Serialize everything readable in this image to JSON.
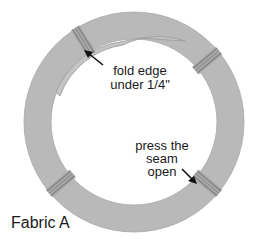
{
  "diagram": {
    "colors": {
      "fabric": "#b9b9b9",
      "fabric_edge": "#a3a3a3",
      "seam_dark": "#8c8c8c",
      "text": "#1a1a1a",
      "background": "#ffffff"
    },
    "ring": {
      "center": [
        134,
        122
      ],
      "outer_radius": 110,
      "inner_radius": 83
    },
    "seams": [
      {
        "name": "seam-top-left",
        "angle_deg": -122
      },
      {
        "name": "seam-top-right",
        "angle_deg": -40
      },
      {
        "name": "seam-bottom-right",
        "angle_deg": 40
      },
      {
        "name": "seam-bottom-left",
        "angle_deg": 140
      }
    ],
    "labels": {
      "fold_line1": "fold edge",
      "fold_line2": "under 1/4\"",
      "press_line1": "press the",
      "press_line2": "seam",
      "press_line3": "open",
      "fabric_name": "Fabric A"
    }
  }
}
